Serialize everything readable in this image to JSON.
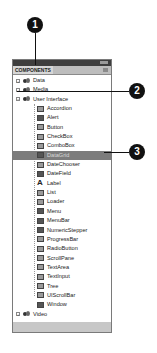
{
  "panel": {
    "title_tab": "COMPONENTS",
    "tree": [
      {
        "label": "Data",
        "type": "folder",
        "expanded": false,
        "level": 0
      },
      {
        "label": "Media",
        "type": "folder",
        "expanded": false,
        "level": 0
      },
      {
        "label": "User Interface",
        "type": "folder",
        "expanded": true,
        "level": 0
      },
      {
        "label": "Accordion",
        "type": "component",
        "icon": "accordion-icon",
        "level": 1
      },
      {
        "label": "Alert",
        "type": "component",
        "icon": "alert-icon",
        "level": 1
      },
      {
        "label": "Button",
        "type": "component",
        "icon": "button-icon",
        "level": 1
      },
      {
        "label": "CheckBox",
        "type": "component",
        "icon": "checkbox-icon",
        "level": 1
      },
      {
        "label": "ComboBox",
        "type": "component",
        "icon": "combobox-icon",
        "level": 1
      },
      {
        "label": "DataGrid",
        "type": "component",
        "icon": "datagrid-icon",
        "level": 1,
        "selected": true
      },
      {
        "label": "DateChooser",
        "type": "component",
        "icon": "datechooser-icon",
        "level": 1
      },
      {
        "label": "DateField",
        "type": "component",
        "icon": "datefield-icon",
        "level": 1
      },
      {
        "label": "Label",
        "type": "component",
        "icon": "label-icon",
        "level": 1
      },
      {
        "label": "List",
        "type": "component",
        "icon": "list-icon",
        "level": 1
      },
      {
        "label": "Loader",
        "type": "component",
        "icon": "loader-icon",
        "level": 1
      },
      {
        "label": "Menu",
        "type": "component",
        "icon": "menu-icon",
        "level": 1
      },
      {
        "label": "MenuBar",
        "type": "component",
        "icon": "menubar-icon",
        "level": 1
      },
      {
        "label": "NumericStepper",
        "type": "component",
        "icon": "numericstepper-icon",
        "level": 1
      },
      {
        "label": "ProgressBar",
        "type": "component",
        "icon": "progressbar-icon",
        "level": 1
      },
      {
        "label": "RadioButton",
        "type": "component",
        "icon": "radiobutton-icon",
        "level": 1
      },
      {
        "label": "ScrollPane",
        "type": "component",
        "icon": "scrollpane-icon",
        "level": 1
      },
      {
        "label": "TextArea",
        "type": "component",
        "icon": "textarea-icon",
        "level": 1
      },
      {
        "label": "TextInput",
        "type": "component",
        "icon": "textinput-icon",
        "level": 1
      },
      {
        "label": "Tree",
        "type": "component",
        "icon": "tree-icon",
        "level": 1
      },
      {
        "label": "UIScrollBar",
        "type": "component",
        "icon": "uiscrollbar-icon",
        "level": 1
      },
      {
        "label": "Window",
        "type": "component",
        "icon": "window-icon",
        "level": 1
      },
      {
        "label": "Video",
        "type": "folder",
        "expanded": false,
        "level": 0
      }
    ]
  },
  "callouts": [
    {
      "number": "1"
    },
    {
      "number": "2"
    },
    {
      "number": "3"
    }
  ],
  "colors": {
    "titlebar": "#3e3e3e",
    "selected_row": "#7c7c7c",
    "callout": "#111111"
  }
}
